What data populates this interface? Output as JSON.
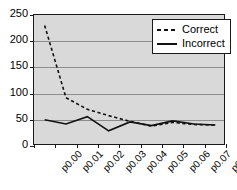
{
  "chart_data": {
    "type": "line",
    "title": "",
    "xlabel": "",
    "ylabel": "",
    "categories": [
      "p0.00",
      "p0.01",
      "p0.02",
      "p0.03",
      "p0.04",
      "p0.05",
      "p0.06",
      "p0.07",
      "p0.08"
    ],
    "series": [
      {
        "name": "Correct",
        "style": "dashed",
        "color": "#111111",
        "values": [
          230,
          92,
          70,
          58,
          47,
          38,
          45,
          41,
          40
        ]
      },
      {
        "name": "Incorrect",
        "style": "solid",
        "color": "#111111",
        "values": [
          50,
          42,
          56,
          29,
          46,
          39,
          48,
          42,
          40
        ]
      }
    ],
    "ylim": [
      0,
      250
    ],
    "yticks": [
      0,
      50,
      100,
      150,
      200,
      250
    ],
    "ytick_labels": [
      "0",
      "50",
      "100",
      "150",
      "200",
      "250"
    ],
    "grid": true,
    "legend_position": "top-right",
    "plot_background": "#d9d9d9",
    "axis_color": "#1a1a1a",
    "grid_color": "#8c8c8c"
  },
  "legend": {
    "entries": [
      {
        "label": "Correct"
      },
      {
        "label": "Incorrect"
      }
    ]
  }
}
